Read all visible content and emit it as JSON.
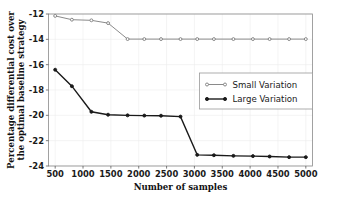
{
  "chart_data": {
    "type": "line",
    "title": "",
    "xlabel": "Number of samples",
    "ylabel": "Percentage differential cost over the optimal baseline strategy",
    "ylabel_lines": [
      "Percentage differential cost over",
      "the optimal baseline strategy"
    ],
    "xlim": [
      380,
      5120
    ],
    "ylim": [
      -24,
      -12
    ],
    "xticks": [
      500,
      1000,
      1500,
      2000,
      2500,
      3000,
      3500,
      4000,
      4500,
      5000
    ],
    "xtick_labels": [
      "500",
      "1000",
      "1500",
      "2000",
      "2500",
      "3000",
      "3500",
      "4000",
      "4500",
      "5000"
    ],
    "yticks": [
      -24,
      -22,
      -20,
      -18,
      -16,
      -14,
      -12
    ],
    "ytick_labels": [
      "-24",
      "-22",
      "-20",
      "-18",
      "-16",
      "-14",
      "-12"
    ],
    "grid": true,
    "legend_position": "center-right",
    "series": [
      {
        "name": "Small Variation",
        "color": "#7d7d7d",
        "marker": "circle",
        "marker_filled": false,
        "line_width": 0.9,
        "x": [
          500,
          800,
          1150,
          1450,
          1800,
          2100,
          2400,
          2750,
          3050,
          3350,
          3700,
          4050,
          4350,
          4700,
          5000
        ],
        "y": [
          -12.15,
          -12.45,
          -12.5,
          -12.72,
          -13.98,
          -13.98,
          -13.98,
          -13.98,
          -13.98,
          -13.98,
          -13.98,
          -13.98,
          -13.98,
          -13.98,
          -13.98
        ]
      },
      {
        "name": "Large Variation",
        "color": "#1a1a1a",
        "marker": "circle",
        "marker_filled": true,
        "line_width": 1.4,
        "x": [
          500,
          800,
          1150,
          1450,
          1800,
          2100,
          2400,
          2750,
          3050,
          3350,
          3700,
          4050,
          4350,
          4700,
          5000
        ],
        "y": [
          -16.4,
          -17.7,
          -19.72,
          -19.95,
          -20.0,
          -20.02,
          -20.03,
          -20.1,
          -23.12,
          -23.15,
          -23.2,
          -23.22,
          -23.25,
          -23.3,
          -23.3
        ]
      }
    ]
  },
  "legend": {
    "entries": [
      {
        "label": "Small Variation"
      },
      {
        "label": "Large Variation"
      }
    ]
  }
}
